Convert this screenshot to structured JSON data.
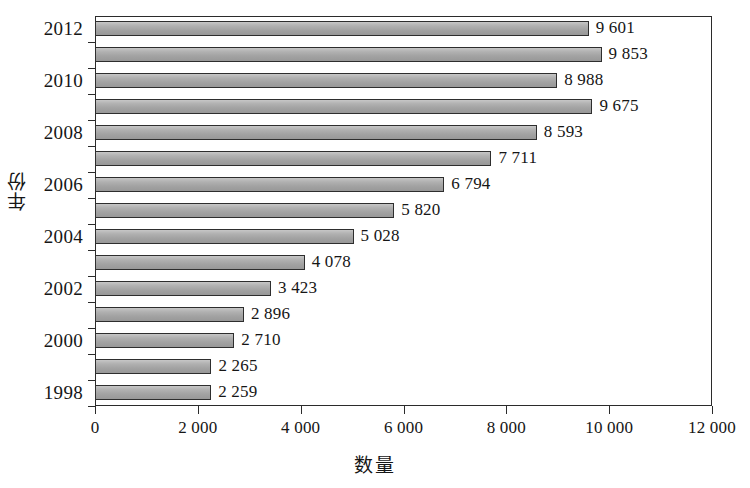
{
  "chart_data": {
    "type": "bar",
    "orientation": "horizontal",
    "title": "",
    "xlabel": "数量",
    "ylabel": "年份",
    "xlim": [
      0,
      12000
    ],
    "xticks": [
      0,
      2000,
      4000,
      6000,
      8000,
      10000,
      12000
    ],
    "xticklabels": [
      "0",
      "2 000",
      "4 000",
      "6 000",
      "8 000",
      "10 000",
      "12 000"
    ],
    "yticks": [
      2012,
      2010,
      2008,
      2006,
      2004,
      2002,
      2000,
      1998
    ],
    "yticklabels": [
      "2012",
      "2010",
      "2008",
      "2006",
      "2004",
      "2002",
      "2000",
      "1998"
    ],
    "grid": false,
    "legend": null,
    "bar_color": "#a9a9a9",
    "bar_edge_color": "#2e2e2e",
    "frame_color": "#2b2b2b",
    "background": "#ffffff",
    "categories": [
      2012,
      2011,
      2010,
      2009,
      2008,
      2007,
      2006,
      2005,
      2004,
      2003,
      2002,
      2001,
      2000,
      1999,
      1998
    ],
    "values": [
      9601,
      9853,
      8988,
      9675,
      8593,
      7711,
      6794,
      5820,
      5028,
      4078,
      3423,
      2896,
      2710,
      2265,
      2259
    ],
    "data_labels": [
      "9 601",
      "9 853",
      "8 988",
      "9 675",
      "8 593",
      "7 711",
      "6 794",
      "5 820",
      "5 028",
      "4 078",
      "3 423",
      "2 896",
      "2 710",
      "2 265",
      "2 259"
    ]
  }
}
